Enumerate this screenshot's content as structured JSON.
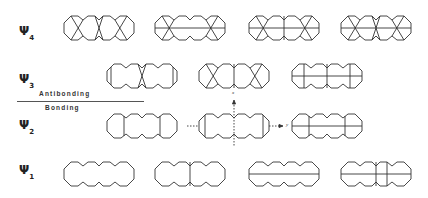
{
  "levels": [
    {
      "symbol": "Ψ",
      "index": "4"
    },
    {
      "symbol": "Ψ",
      "index": "3"
    },
    {
      "symbol": "Ψ",
      "index": "2"
    },
    {
      "symbol": "Ψ",
      "index": "1"
    }
  ],
  "labels": {
    "antibonding": "Antibonding",
    "bonding": "Bonding"
  },
  "axes": {
    "x_label": "x",
    "y_label": "y"
  },
  "diagrams": {
    "psi4": [
      "tri-X nodes",
      "two-center star with horizontal node",
      "center vertical + two stars",
      "three stars"
    ],
    "psi3": [
      "end verticals with central X",
      "X ends with central vertical",
      "horizontal + three verticals"
    ],
    "psi2": [
      "two verticals",
      "verticals with axes",
      "horizontal + two verticals"
    ],
    "psi1": [
      "no node",
      "one vertical",
      "one horizontal",
      "horizontal + two verticals"
    ]
  },
  "colors": {
    "line": "#333333",
    "background": "#ffffff"
  }
}
